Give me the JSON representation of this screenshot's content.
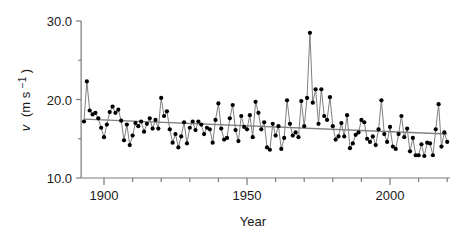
{
  "chart_data": {
    "type": "line",
    "title": "",
    "subtitle": "",
    "xlabel": "Year",
    "ylabel": "v (m s⁻¹)",
    "ylabel_parts": {
      "symbol": "v",
      "units": "(m s",
      "exponent": "−1",
      "close": ")"
    },
    "xlim": [
      1892,
      2021
    ],
    "ylim": [
      10.0,
      30.0
    ],
    "grid": false,
    "legend": "none",
    "x_major_ticks": [
      1900,
      1950,
      2000
    ],
    "x_major_tick_labels": [
      "1900",
      "1950",
      "2000"
    ],
    "x_minor_tick_step": 10,
    "y_major_ticks": [
      10.0,
      20.0,
      30.0
    ],
    "y_major_tick_labels": [
      "10.0",
      "20.0",
      "30.0"
    ],
    "y_minor_ticks": [
      15.0,
      25.0
    ],
    "marker": "filled-circle",
    "line_color": "#808080",
    "marker_color": "#000000",
    "trend_color": "#808080",
    "axis_color": "#7a7a7a",
    "series": [
      {
        "name": "annual mean wind speed",
        "x": [
          1893,
          1894,
          1895,
          1896,
          1897,
          1898,
          1899,
          1900,
          1901,
          1902,
          1903,
          1904,
          1905,
          1906,
          1907,
          1908,
          1909,
          1910,
          1911,
          1912,
          1913,
          1914,
          1915,
          1916,
          1917,
          1918,
          1919,
          1920,
          1921,
          1922,
          1923,
          1924,
          1925,
          1926,
          1927,
          1928,
          1929,
          1930,
          1931,
          1932,
          1933,
          1934,
          1935,
          1936,
          1937,
          1938,
          1939,
          1940,
          1941,
          1942,
          1943,
          1944,
          1945,
          1946,
          1947,
          1948,
          1949,
          1950,
          1951,
          1952,
          1953,
          1954,
          1955,
          1956,
          1957,
          1958,
          1959,
          1960,
          1961,
          1962,
          1963,
          1964,
          1965,
          1966,
          1967,
          1968,
          1969,
          1970,
          1971,
          1972,
          1973,
          1974,
          1975,
          1976,
          1977,
          1978,
          1979,
          1980,
          1981,
          1982,
          1983,
          1984,
          1985,
          1986,
          1987,
          1988,
          1989,
          1990,
          1991,
          1992,
          1993,
          1994,
          1995,
          1996,
          1997,
          1998,
          1999,
          2000,
          2001,
          2002,
          2003,
          2004,
          2005,
          2006,
          2007,
          2008,
          2009,
          2010,
          2011,
          2012,
          2013,
          2014,
          2015,
          2016,
          2017,
          2018,
          2019,
          2020
        ],
        "values": [
          17.2,
          22.3,
          18.6,
          18.1,
          18.3,
          17.6,
          16.4,
          15.2,
          16.8,
          18.4,
          19.1,
          18.3,
          18.7,
          17.3,
          14.8,
          16.8,
          14.2,
          15.4,
          17.0,
          16.6,
          17.2,
          15.9,
          16.9,
          17.6,
          16.3,
          17.4,
          16.3,
          20.2,
          17.9,
          18.5,
          16.2,
          14.5,
          15.6,
          13.9,
          15.3,
          17.1,
          14.4,
          16.4,
          17.2,
          16.1,
          17.2,
          16.8,
          15.6,
          16.4,
          16.2,
          14.5,
          17.4,
          19.5,
          16.3,
          14.9,
          15.1,
          17.6,
          19.3,
          16.1,
          14.7,
          17.9,
          16.5,
          16.2,
          18.0,
          15.2,
          19.7,
          18.3,
          16.2,
          17.1,
          13.9,
          13.6,
          16.9,
          15.4,
          16.6,
          13.7,
          15.1,
          19.9,
          16.9,
          15.4,
          15.8,
          15.2,
          19.8,
          16.6,
          20.2,
          28.5,
          19.6,
          21.3,
          16.9,
          21.3,
          17.9,
          17.4,
          20.3,
          16.6,
          14.9,
          15.3,
          17.0,
          15.3,
          18.0,
          13.8,
          14.4,
          15.5,
          15.8,
          17.4,
          17.1,
          15.0,
          14.6,
          15.3,
          14.2,
          16.2,
          19.9,
          15.6,
          14.6,
          16.5,
          14.0,
          13.7,
          15.6,
          17.9,
          15.2,
          16.3,
          13.4,
          15.1,
          12.9,
          12.9,
          14.3,
          12.8,
          14.5,
          14.4,
          12.9,
          16.2,
          19.4,
          14.0,
          15.8,
          14.6
        ]
      }
    ],
    "trend": {
      "name": "linear trend",
      "x": [
        1893,
        2020
      ],
      "values": [
        17.5,
        15.6
      ],
      "description": "declining linear regression line"
    }
  }
}
